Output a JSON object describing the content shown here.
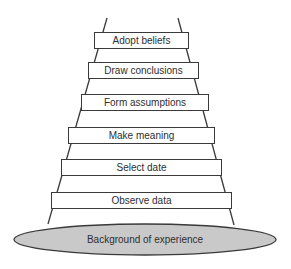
{
  "diagram": {
    "type": "ladder-of-inference",
    "rungs": [
      {
        "label": "Adopt beliefs",
        "x": 94,
        "y": 32,
        "w": 95,
        "h": 17
      },
      {
        "label": "Draw conclusions",
        "x": 88,
        "y": 62,
        "w": 111,
        "h": 17
      },
      {
        "label": "Form assumptions",
        "x": 81,
        "y": 94,
        "w": 128,
        "h": 17
      },
      {
        "label": "Make meaning",
        "x": 68,
        "y": 127,
        "w": 147,
        "h": 17
      },
      {
        "label": "Select date",
        "x": 61,
        "y": 159,
        "w": 161,
        "h": 17
      },
      {
        "label": "Observe data",
        "x": 51,
        "y": 192,
        "w": 181,
        "h": 17
      }
    ],
    "base": {
      "label": "Background of experience",
      "fill": "#c9c9c9",
      "stroke": "#3a3a3a"
    },
    "rails": {
      "left": {
        "x1": 107,
        "y1": 18,
        "x2": 48,
        "y2": 224
      },
      "right": {
        "x1": 178,
        "y1": 18,
        "x2": 234,
        "y2": 225
      },
      "stroke": "#3a3a3a"
    }
  }
}
